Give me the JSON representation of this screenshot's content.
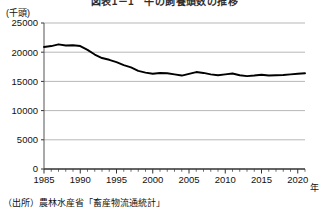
{
  "chart_data": {
    "type": "line",
    "title": "図表1－1　牛の飼養頭数の推移",
    "ylabel": "(千頭)",
    "xlabel": "年",
    "ylim": [
      0,
      25000
    ],
    "ytick_labels": [
      "0",
      "5000",
      "10000",
      "15000",
      "20000",
      "25000"
    ],
    "yticks": [
      0,
      5000,
      10000,
      15000,
      20000,
      25000
    ],
    "xlim": [
      1985,
      2021
    ],
    "xtick_labels": [
      "1985",
      "1990",
      "1995",
      "2000",
      "2005",
      "2010",
      "2015",
      "2020"
    ],
    "xticks": [
      1985,
      1990,
      1995,
      2000,
      2005,
      2010,
      2015,
      2020
    ],
    "minor_tick_interval": 1,
    "grid": "horizontal",
    "legend": "none",
    "line_color": "#000000",
    "series": [
      {
        "name": "飼養頭数",
        "x": [
          1985,
          1986,
          1987,
          1988,
          1989,
          1990,
          1991,
          1992,
          1993,
          1994,
          1995,
          1996,
          1997,
          1998,
          1999,
          2000,
          2001,
          2002,
          2003,
          2004,
          2005,
          2006,
          2007,
          2008,
          2009,
          2010,
          2011,
          2012,
          2013,
          2014,
          2015,
          2016,
          2017,
          2018,
          2019,
          2020,
          2021
        ],
        "values": [
          20900,
          21050,
          21350,
          21150,
          21200,
          21050,
          20400,
          19600,
          19000,
          18700,
          18300,
          17800,
          17400,
          16800,
          16500,
          16300,
          16450,
          16400,
          16200,
          16000,
          16300,
          16600,
          16450,
          16200,
          16050,
          16200,
          16350,
          16050,
          15900,
          16000,
          16150,
          16000,
          16050,
          16100,
          16200,
          16300,
          16400
        ]
      }
    ],
    "source": "（出所）農林水産省「畜産物流通統計」"
  },
  "layout": {
    "plot_left": 44,
    "plot_right": 305,
    "plot_top": 23,
    "plot_bottom": 169
  }
}
